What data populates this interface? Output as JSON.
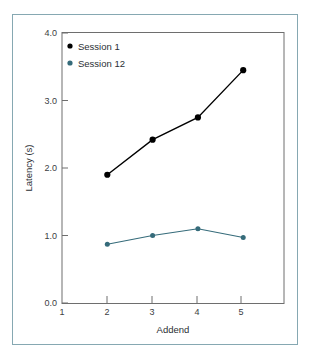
{
  "figure": {
    "frame_color": "#86a8b2",
    "background": "#ffffff",
    "plot_border_color": "#6e6e6e"
  },
  "chart_data": {
    "type": "line",
    "title": "",
    "xlabel": "Addend",
    "ylabel": "Latency (s)",
    "x": [
      2,
      3,
      4,
      5
    ],
    "xlim": [
      1,
      5.9
    ],
    "ylim": [
      0.0,
      4.0
    ],
    "xticks": [
      1,
      2,
      3,
      4,
      5
    ],
    "xtick_labels": [
      "1",
      "2",
      "3",
      "4",
      "5"
    ],
    "yticks": [
      0.0,
      1.0,
      2.0,
      3.0,
      4.0
    ],
    "ytick_labels": [
      "0.0",
      "1.0",
      "2.0",
      "3.0",
      "4.0"
    ],
    "grid": false,
    "legend_position": "top-left",
    "series": [
      {
        "name": "Session 1",
        "color": "#000000",
        "marker": "circle",
        "values": [
          1.9,
          2.42,
          2.75,
          3.45
        ]
      },
      {
        "name": "Session 12",
        "color": "#356b7a",
        "marker": "circle",
        "values": [
          0.87,
          1.0,
          1.1,
          0.97
        ]
      }
    ]
  }
}
